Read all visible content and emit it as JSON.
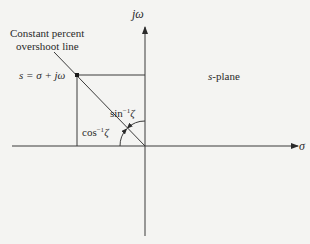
{
  "labels": {
    "imag_axis": "jω",
    "real_axis": "σ",
    "title_line1": "Constant percent",
    "title_line2": "overshoot line",
    "s_point": "s = σ + jω",
    "plane": "s-plane",
    "sin_base": "sin",
    "cos_base": "cos",
    "inverse_exp": "−1",
    "zeta": "ζ"
  },
  "colors": {
    "line": "#3a3a3a",
    "background": "#f4f4f2"
  }
}
